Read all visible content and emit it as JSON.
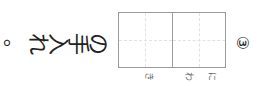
{
  "question": {
    "number": "③",
    "furigana": [
      "に",
      "わ",
      "き"
    ],
    "sentence_chars": [
      "の",
      "手",
      "入",
      "れ",
      "。"
    ],
    "answer_boxes": 2,
    "full_text": "□□の手入れ。",
    "orientation": "rotated 90° clockwise (vertical text)"
  }
}
